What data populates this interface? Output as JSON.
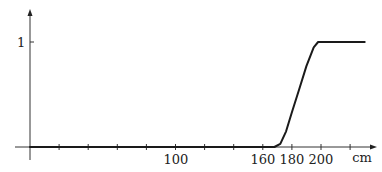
{
  "chart_data": {
    "type": "line",
    "title": "",
    "xlabel": "cm",
    "ylabel": "",
    "x_ticks": [
      20,
      40,
      60,
      80,
      100,
      120,
      140,
      160,
      180,
      200,
      220
    ],
    "x_tick_labels": [
      {
        "value": 100,
        "label": "100"
      },
      {
        "value": 160,
        "label": "160"
      },
      {
        "value": 180,
        "label": "180"
      },
      {
        "value": 200,
        "label": "200"
      }
    ],
    "y_ticks": [
      {
        "value": 1,
        "label": "1"
      }
    ],
    "xlim": [
      0,
      230
    ],
    "ylim": [
      0,
      1.1
    ],
    "grid": false,
    "legend": null,
    "series": [
      {
        "name": "curve",
        "x": [
          0,
          160,
          168,
          172,
          176,
          180,
          185,
          190,
          195,
          198,
          200,
          230
        ],
        "y": [
          0,
          0,
          0,
          0.03,
          0.15,
          0.33,
          0.55,
          0.77,
          0.95,
          1.0,
          1.0,
          1.0
        ]
      }
    ]
  },
  "axis": {
    "x_unit": "cm",
    "y_one_label": "1",
    "labels": {
      "l100": "100",
      "l160": "160",
      "l180": "180",
      "l200": "200"
    }
  }
}
